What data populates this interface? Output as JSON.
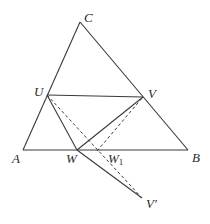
{
  "diagram": {
    "background": "#ffffff",
    "stroke_color": "#3a3a3a",
    "points": {
      "A": {
        "x": 23,
        "y": 150
      },
      "B": {
        "x": 188,
        "y": 150
      },
      "C": {
        "x": 80,
        "y": 22
      },
      "U": {
        "x": 47,
        "y": 95
      },
      "V": {
        "x": 143,
        "y": 97
      },
      "W": {
        "x": 77,
        "y": 150
      },
      "W1": {
        "x": 97,
        "y": 151
      },
      "Vp": {
        "x": 142,
        "y": 198
      }
    },
    "labels": {
      "A": "A",
      "B": "B",
      "C": "C",
      "U": "U",
      "V": "V",
      "W": "W",
      "W1_main": "W",
      "W1_sub": "1",
      "Vp": "V′"
    },
    "solid_segments": [
      [
        "A",
        "C"
      ],
      [
        "C",
        "B"
      ],
      [
        "A",
        "B"
      ],
      [
        "U",
        "V"
      ],
      [
        "U",
        "W"
      ],
      [
        "W",
        "V"
      ],
      [
        "W",
        "Vp"
      ]
    ],
    "dashed_segments": [
      [
        "U",
        "Vp"
      ],
      [
        "W1",
        "V"
      ]
    ]
  }
}
